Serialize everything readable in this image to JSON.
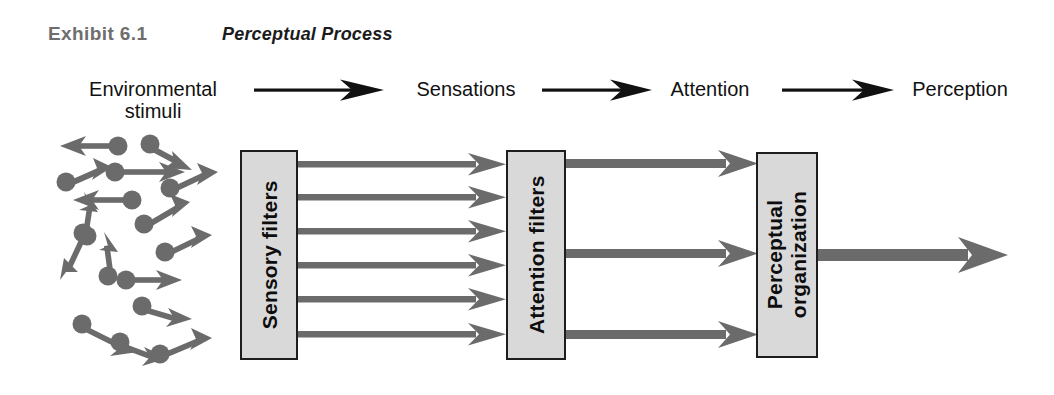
{
  "header": {
    "exhibit_label": "Exhibit 6.1",
    "exhibit_title": "Perceptual Process"
  },
  "flow_labels": [
    {
      "id": "environmental-stimuli",
      "line1": "Environmental",
      "line2": "stimuli"
    },
    {
      "id": "sensations",
      "line1": "Sensations",
      "line2": ""
    },
    {
      "id": "attention",
      "line1": "Attention",
      "line2": ""
    },
    {
      "id": "perception",
      "line1": "Perception",
      "line2": ""
    }
  ],
  "boxes": [
    {
      "id": "sensory-filters",
      "line1": "Sensory filters",
      "line2": ""
    },
    {
      "id": "attention-filters",
      "line1": "Attention filters",
      "line2": ""
    },
    {
      "id": "perceptual-organization",
      "line1": "Perceptual",
      "line2": "organization"
    }
  ],
  "colors": {
    "stimulus_gray": "#6b6b6b",
    "box_fill": "#d9d9d9",
    "box_border": "#1d1d1d",
    "label_black": "#111111",
    "exhibit_label_gray": "#6e6e6e",
    "background": "#ffffff"
  },
  "diagram": {
    "type": "process-flow",
    "stage_width": 1054,
    "stage_height": 395,
    "stimuli_count": 16,
    "sensory_to_attention_arrow_count": 6,
    "attention_to_perceptual_arrow_count": 3,
    "perceptual_output_arrow_count": 1,
    "top_connector_arrow_count": 3,
    "stimuli": [
      {
        "cx": 100,
        "cy": 35,
        "angle": 187
      },
      {
        "cx": 148,
        "cy": 23,
        "angle": 32
      },
      {
        "cx": 22,
        "cy": 80,
        "angle": 332
      },
      {
        "cx": 97,
        "cy": 45,
        "angle": 0
      },
      {
        "cx": 84,
        "cy": 104,
        "angle": 188
      },
      {
        "cx": 121,
        "cy": 126,
        "angle": 318
      },
      {
        "cx": 43,
        "cy": 88,
        "angle": 8
      },
      {
        "cx": 42,
        "cy": 218,
        "angle": 280
      },
      {
        "cx": 38,
        "cy": 222,
        "angle": 112
      },
      {
        "cx": 152,
        "cy": 173,
        "angle": 330
      },
      {
        "cx": 97,
        "cy": 252,
        "angle": 20
      },
      {
        "cx": 108,
        "cy": 248,
        "angle": 0
      },
      {
        "cx": 54,
        "cy": 328,
        "angle": 30
      },
      {
        "cx": 122,
        "cy": 318,
        "angle": 18
      },
      {
        "cx": 161,
        "cy": 360,
        "angle": 344
      },
      {
        "cx": 92,
        "cy": 205,
        "angle": 72
      }
    ]
  }
}
